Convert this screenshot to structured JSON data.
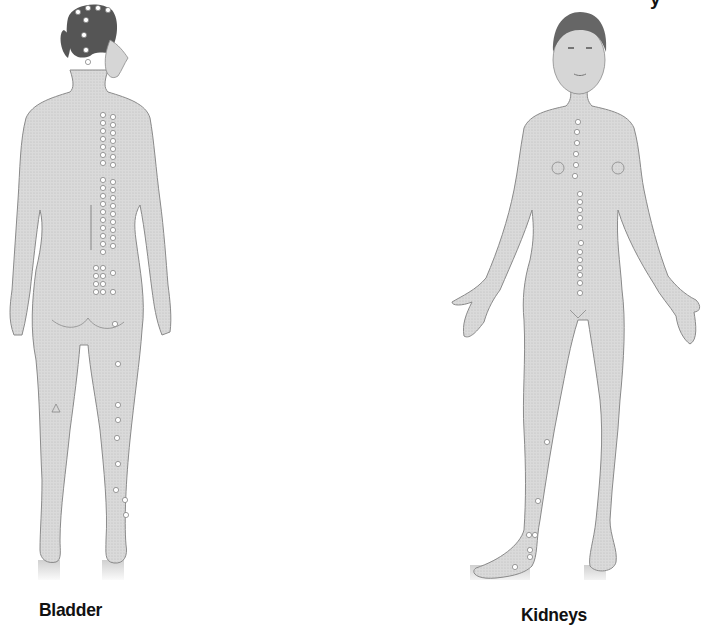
{
  "page": {
    "cropped_top_text": "y"
  },
  "figures": [
    {
      "id": "bladder",
      "view": "back",
      "caption": "Bladder",
      "meridian": "bladder-meridian",
      "skin_color": "#d9d9d9",
      "outline_color": "#8a8a8a",
      "hair_color": "#555555",
      "point_color": "#ffffff",
      "points": [
        [
          78,
          12
        ],
        [
          88,
          8
        ],
        [
          98,
          8
        ],
        [
          108,
          10
        ],
        [
          86,
          20
        ],
        [
          84,
          35
        ],
        [
          86,
          50
        ],
        [
          88,
          62
        ],
        [
          103,
          115
        ],
        [
          113,
          117
        ],
        [
          103,
          123
        ],
        [
          113,
          125
        ],
        [
          103,
          131
        ],
        [
          113,
          133
        ],
        [
          103,
          139
        ],
        [
          113,
          141
        ],
        [
          103,
          147
        ],
        [
          113,
          149
        ],
        [
          103,
          155
        ],
        [
          113,
          157
        ],
        [
          103,
          163
        ],
        [
          113,
          165
        ],
        [
          103,
          180
        ],
        [
          113,
          182
        ],
        [
          103,
          188
        ],
        [
          113,
          190
        ],
        [
          103,
          196
        ],
        [
          113,
          198
        ],
        [
          103,
          204
        ],
        [
          113,
          206
        ],
        [
          103,
          212
        ],
        [
          113,
          214
        ],
        [
          103,
          220
        ],
        [
          113,
          222
        ],
        [
          103,
          228
        ],
        [
          113,
          230
        ],
        [
          103,
          236
        ],
        [
          113,
          238
        ],
        [
          103,
          244
        ],
        [
          113,
          246
        ],
        [
          103,
          252
        ],
        [
          96,
          268
        ],
        [
          103,
          268
        ],
        [
          96,
          276
        ],
        [
          103,
          276
        ],
        [
          96,
          284
        ],
        [
          103,
          284
        ],
        [
          96,
          292
        ],
        [
          103,
          292
        ],
        [
          113,
          273
        ],
        [
          113,
          292
        ],
        [
          115,
          324
        ],
        [
          118,
          364
        ],
        [
          118,
          405
        ],
        [
          118,
          420
        ],
        [
          117,
          438
        ],
        [
          118,
          464
        ],
        [
          116,
          490
        ],
        [
          125,
          500
        ],
        [
          126,
          515
        ]
      ]
    },
    {
      "id": "kidneys",
      "view": "front",
      "caption": "Kidneys",
      "meridian": "kidney-meridian",
      "skin_color": "#d9d9d9",
      "outline_color": "#8a8a8a",
      "hair_color": "#666666",
      "point_color": "#ffffff",
      "points": [
        [
          578,
          122
        ],
        [
          577,
          132
        ],
        [
          577,
          143
        ],
        [
          576,
          154
        ],
        [
          576,
          165
        ],
        [
          575,
          176
        ],
        [
          580,
          194
        ],
        [
          580,
          202
        ],
        [
          580,
          210
        ],
        [
          580,
          218
        ],
        [
          580,
          227
        ],
        [
          581,
          243
        ],
        [
          580,
          252
        ],
        [
          580,
          260
        ],
        [
          580,
          268
        ],
        [
          580,
          275
        ],
        [
          580,
          283
        ],
        [
          580,
          293
        ],
        [
          547,
          442
        ],
        [
          538,
          501
        ],
        [
          529,
          535
        ],
        [
          535,
          535
        ],
        [
          530,
          550
        ],
        [
          530,
          557
        ],
        [
          515,
          567
        ]
      ]
    }
  ]
}
